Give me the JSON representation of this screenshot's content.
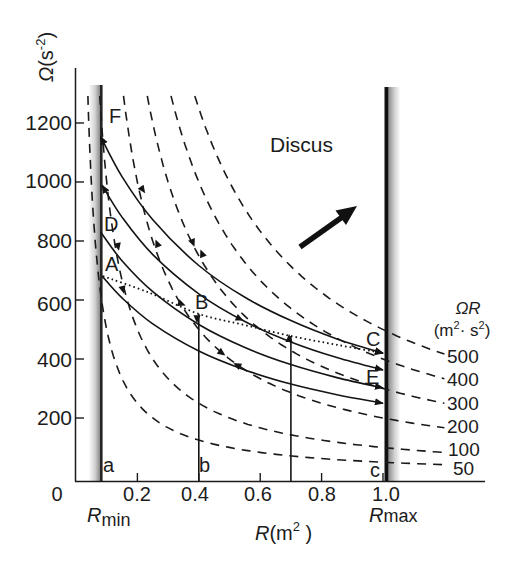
{
  "figure": {
    "title": "Discus",
    "y_axis_label": {
      "symbol": "Ω",
      "open": "(s",
      "sup": "-2",
      "close": ")"
    },
    "x_axis_label": {
      "symbol": "R",
      "open": "(m",
      "sup": "2",
      "close": " )"
    },
    "y_tick_labels": [
      "1200",
      "1000",
      "800",
      "600",
      "400",
      "200"
    ],
    "x_tick_labels": [
      "0",
      "0.2",
      "0.4",
      "0.6",
      "0.8",
      "1.0"
    ],
    "r_min_label": {
      "symbol": "R",
      "suffix": "min"
    },
    "r_max_label": {
      "symbol": "R",
      "suffix": "max"
    },
    "iso_legend": {
      "title": "ΩR",
      "unit_open": "(m",
      "unit_sup1": "2",
      "unit_mid": "· s",
      "unit_sup2": "2",
      "unit_close": ")",
      "values": [
        "500",
        "400",
        "300",
        "200",
        "100",
        "50"
      ]
    },
    "point_labels": {
      "F": "F",
      "D": "D",
      "A": "A",
      "B": "B",
      "C": "C",
      "E": "E",
      "a": "a",
      "b": "b",
      "c": "c"
    }
  },
  "chart_data": {
    "type": "line",
    "title": "Discus",
    "xlabel": "R (m²)",
    "ylabel": "Ω (s⁻²)",
    "xlim": [
      0,
      1.2
    ],
    "ylim": [
      0,
      1300
    ],
    "x_ticks": [
      0,
      0.2,
      0.4,
      0.6,
      0.8,
      1.0
    ],
    "y_ticks": [
      200,
      400,
      600,
      800,
      1000,
      1200
    ],
    "grid": false,
    "legend_position": "right (iso-line labels)",
    "bounds": {
      "R_min": 0.08,
      "R_max": 1.0
    },
    "iso_lines": {
      "name": "ΩR = constant (m²·s²), dashed",
      "values": [
        500,
        400,
        300,
        200,
        100,
        50
      ],
      "R_end": 1.2
    },
    "series": [
      {
        "name": "F",
        "style": "solid",
        "arrow_start": true,
        "arrow_end": true,
        "points": [
          [
            0.08,
            1154
          ],
          [
            0.15,
            1018
          ],
          [
            0.25,
            872
          ],
          [
            0.4,
            717
          ],
          [
            0.55,
            609
          ],
          [
            0.7,
            530
          ],
          [
            0.85,
            468
          ],
          [
            1.0,
            420
          ]
        ]
      },
      {
        "name": "curve-2",
        "style": "solid",
        "arrow_start": true,
        "arrow_end": true,
        "points": [
          [
            0.085,
            989
          ],
          [
            0.15,
            881
          ],
          [
            0.25,
            754
          ],
          [
            0.4,
            621
          ],
          [
            0.55,
            527
          ],
          [
            0.7,
            458
          ],
          [
            0.85,
            405
          ],
          [
            1.0,
            363
          ]
        ]
      },
      {
        "name": "D",
        "style": "solid",
        "arrow_start": false,
        "arrow_end": true,
        "points": [
          [
            0.08,
            831
          ],
          [
            0.15,
            733
          ],
          [
            0.25,
            628
          ],
          [
            0.4,
            517
          ],
          [
            0.55,
            439
          ],
          [
            0.7,
            381
          ],
          [
            0.85,
            337
          ],
          [
            1.0,
            302
          ]
        ]
      },
      {
        "name": "A",
        "style": "solid",
        "arrow_start": false,
        "arrow_end": true,
        "points": [
          [
            0.085,
            681
          ],
          [
            0.15,
            607
          ],
          [
            0.25,
            519
          ],
          [
            0.4,
            427
          ],
          [
            0.55,
            363
          ],
          [
            0.7,
            315
          ],
          [
            0.85,
            279
          ],
          [
            1.0,
            250
          ]
        ]
      },
      {
        "name": "A-B-C",
        "style": "dotted",
        "arrow_start": false,
        "arrow_end": true,
        "points": [
          [
            0.088,
            681
          ],
          [
            0.24,
            624
          ],
          [
            0.4,
            553
          ],
          [
            0.55,
            515
          ],
          [
            0.7,
            478
          ],
          [
            0.85,
            448
          ],
          [
            1.0,
            420
          ]
        ]
      }
    ],
    "vertical_lines": [
      {
        "R": 0.4,
        "Omega_top": 553,
        "label": "b"
      },
      {
        "R": 0.7,
        "Omega_top": 478
      }
    ],
    "direction_arrows": [
      {
        "R": 0.218,
        "Omega": 973,
        "angle": 55
      },
      {
        "R": 0.381,
        "Omega": 793,
        "angle": 68
      },
      {
        "R": 0.264,
        "Omega": 793,
        "angle": -112
      },
      {
        "R": 0.345,
        "Omega": 586,
        "angle": 20
      },
      {
        "R": 0.534,
        "Omega": 536,
        "angle": 25
      },
      {
        "R": 0.394,
        "Omega": 535,
        "angle": 90
      },
      {
        "R": 0.694,
        "Omega": 471,
        "angle": -90
      },
      {
        "R": 0.137,
        "Omega": 780,
        "angle": 78
      },
      {
        "R": 0.41,
        "Omega": 759,
        "angle": -112
      },
      {
        "R": 0.153,
        "Omega": 634,
        "angle": 75
      },
      {
        "R": 0.476,
        "Omega": 420,
        "angle": 35
      },
      {
        "R": 0.524,
        "Omega": 380,
        "angle": -150
      }
    ],
    "annotations": [
      {
        "type": "text",
        "text": "Discus"
      },
      {
        "type": "arrow",
        "from": [
          0.73,
          780
        ],
        "to": [
          0.915,
          919
        ]
      }
    ]
  }
}
